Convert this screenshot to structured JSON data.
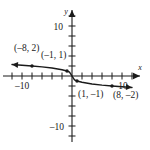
{
  "figure": {
    "title": "",
    "background_color": "#ffffff",
    "ink_color": "#1a1a1a"
  },
  "chart_data": {
    "type": "line",
    "title": "",
    "xlabel": "x",
    "ylabel": "y",
    "xlim": [
      -13,
      13
    ],
    "ylim": [
      -13,
      13
    ],
    "grid": false,
    "legend": "none",
    "x_tick_labels": [
      {
        "value": -10,
        "text": "–10"
      },
      {
        "value": 10,
        "text": "10"
      }
    ],
    "y_tick_labels": [
      {
        "value": 10,
        "text": "10"
      },
      {
        "value": -10,
        "text": "–10"
      }
    ],
    "x_tick_values": [
      -12,
      -10,
      -8,
      -6,
      -4,
      -2,
      2,
      4,
      6,
      8,
      10,
      12
    ],
    "y_tick_values": [
      -12,
      -10,
      -8,
      -6,
      -4,
      -2,
      2,
      4,
      6,
      8,
      10,
      12
    ],
    "series": [
      {
        "name": "curve",
        "description": "decreasing odd root-like curve through the origin, arrows at both ends",
        "arrow_start": true,
        "arrow_end": true,
        "x": [
          -12,
          -10,
          -8,
          -6,
          -4,
          -2,
          -1,
          -0.5,
          0,
          0.5,
          1,
          2,
          4,
          6,
          8,
          10,
          12
        ],
        "y": [
          2.29,
          2.15,
          2.0,
          1.82,
          1.59,
          1.26,
          1.0,
          0.79,
          0,
          -0.79,
          -1.0,
          -1.26,
          -1.59,
          -1.82,
          -2.0,
          -2.15,
          -2.29
        ]
      }
    ],
    "points": [
      {
        "id": "p1",
        "x": -8,
        "y": 2,
        "label": "(–8, 2)",
        "label_x": -11.6,
        "label_y": 5.1
      },
      {
        "id": "p2",
        "x": -1,
        "y": 1,
        "label": "(–1, 1)",
        "label_x": -6.2,
        "label_y": 3.6
      },
      {
        "id": "p3",
        "x": 1,
        "y": -1,
        "label": "(1, –1)",
        "label_x": 1.2,
        "label_y": -4.2
      },
      {
        "id": "p4",
        "x": 8,
        "y": -2,
        "label": "(8, –2)",
        "label_x": 8.2,
        "label_y": -4.4
      }
    ]
  }
}
